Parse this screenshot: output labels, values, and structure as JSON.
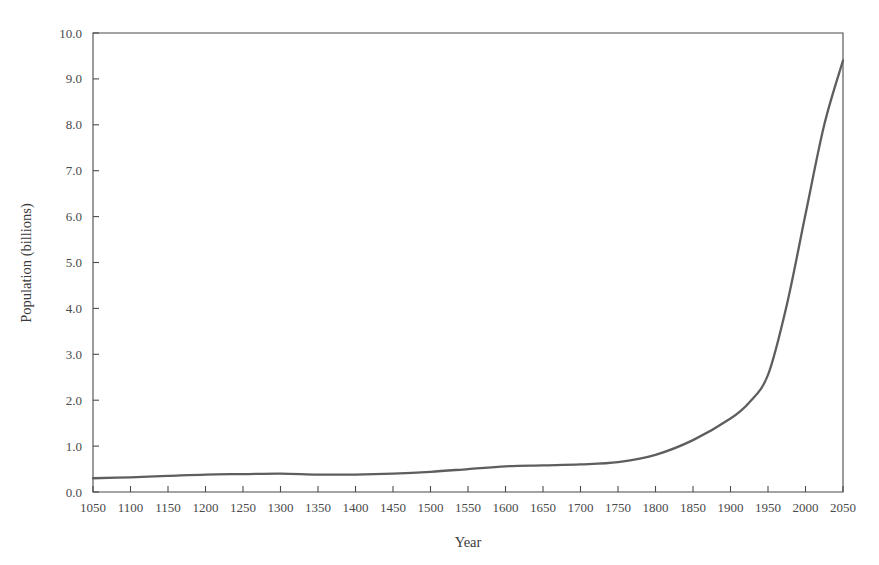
{
  "chart_data": {
    "type": "line",
    "title": "",
    "xlabel": "Year",
    "ylabel": "Population (billions)",
    "xlim": [
      1050,
      2050
    ],
    "ylim": [
      0.0,
      10.0
    ],
    "grid": false,
    "legend": "none",
    "x_ticks": [
      1050,
      1100,
      1150,
      1200,
      1250,
      1300,
      1350,
      1400,
      1450,
      1500,
      1550,
      1600,
      1650,
      1700,
      1750,
      1800,
      1850,
      1900,
      1950,
      2000,
      2050
    ],
    "x_tick_labels": [
      "1050",
      "1100",
      "1150",
      "1200",
      "1250",
      "1300",
      "1350",
      "1400",
      "1450",
      "1500",
      "1550",
      "1600",
      "1650",
      "1700",
      "1750",
      "1800",
      "1850",
      "1900",
      "1950",
      "2000",
      "2050"
    ],
    "y_ticks": [
      0.0,
      1.0,
      2.0,
      3.0,
      4.0,
      5.0,
      6.0,
      7.0,
      8.0,
      9.0,
      10.0
    ],
    "y_tick_labels": [
      "0.0",
      "1.0",
      "2.0",
      "3.0",
      "4.0",
      "5.0",
      "6.0",
      "7.0",
      "8.0",
      "9.0",
      "10.0"
    ],
    "series": [
      {
        "name": "World population",
        "color": "#5e5e5e",
        "x": [
          1050,
          1100,
          1150,
          1200,
          1250,
          1300,
          1350,
          1400,
          1450,
          1500,
          1550,
          1600,
          1650,
          1700,
          1750,
          1800,
          1850,
          1900,
          1925,
          1950,
          1975,
          2000,
          2025,
          2050
        ],
        "values": [
          0.3,
          0.32,
          0.35,
          0.38,
          0.39,
          0.4,
          0.38,
          0.38,
          0.4,
          0.44,
          0.5,
          0.56,
          0.58,
          0.6,
          0.65,
          0.81,
          1.13,
          1.6,
          1.95,
          2.55,
          4.07,
          6.05,
          8.0,
          9.4
        ]
      }
    ]
  },
  "axis": {
    "x_title": "Year",
    "y_title": "Population (billions)"
  }
}
